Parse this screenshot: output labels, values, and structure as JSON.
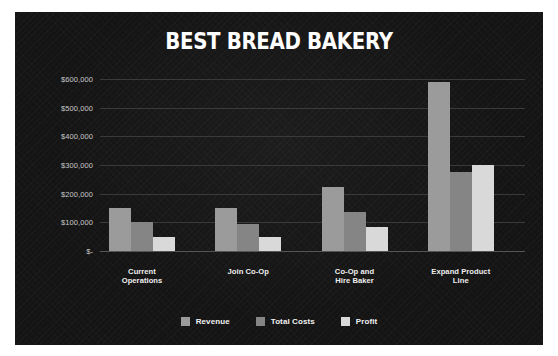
{
  "chart_data": {
    "type": "bar",
    "title": "BEST BREAD BAKERY",
    "xlabel": "",
    "ylabel": "",
    "categories": [
      "Current\nOperations",
      "Join Co-Op",
      "Co-Op and\nHire Baker",
      "Expand Product\nLine"
    ],
    "series": [
      {
        "name": "Revenue",
        "color": "#9b9b9b",
        "values": [
          150000,
          150000,
          225000,
          590000
        ]
      },
      {
        "name": "Total Costs",
        "color": "#858585",
        "values": [
          100000,
          95000,
          135000,
          275000
        ]
      },
      {
        "name": "Profit",
        "color": "#d9d9d9",
        "values": [
          50000,
          50000,
          85000,
          300000
        ]
      }
    ],
    "ylim": [
      0,
      600000
    ],
    "yticks": [
      {
        "value": 0,
        "label": "$-"
      },
      {
        "value": 100000,
        "label": "$100,000"
      },
      {
        "value": 200000,
        "label": "$200,000"
      },
      {
        "value": 300000,
        "label": "$300,000"
      },
      {
        "value": 400000,
        "label": "$400,000"
      },
      {
        "value": 500000,
        "label": "$500,000"
      },
      {
        "value": 600000,
        "label": "$600,000"
      }
    ],
    "grid": true,
    "legend_position": "bottom",
    "background_color": "#141414",
    "gridline_color": "#3a3a3a",
    "text_color": "#ffffff"
  }
}
